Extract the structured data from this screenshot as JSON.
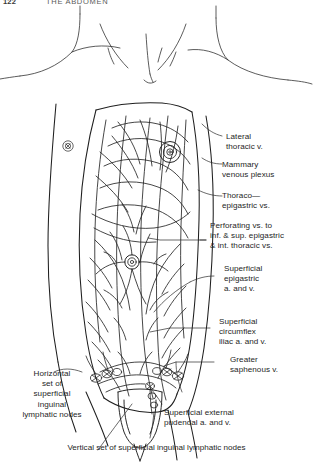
{
  "header": {
    "folio": "122",
    "running_title": "THE ABDOMEN"
  },
  "figure": {
    "ink_color": "#1f1f1f",
    "line_color": "#3a3a3a"
  },
  "labels": [
    {
      "id": "lateral-thoracic-vein",
      "text": "Lateral\nthoracic v."
    },
    {
      "id": "mammary-venous-plexus",
      "text": "Mammary\nvenous plexus"
    },
    {
      "id": "thoraco-epigastric-veins",
      "text": "Thoraco—\nepigastric vs."
    },
    {
      "id": "perforating-veins",
      "text": "Perforating vs. to\ninf. & sup. epigastric\n& int. thoracic vs."
    },
    {
      "id": "superficial-epigastric",
      "text": "Superficial\nepigastric\na. and v."
    },
    {
      "id": "superficial-circumflex-iliac",
      "text": "Superficial\ncircumflex\niliac a. and v."
    },
    {
      "id": "greater-saphenous-vein",
      "text": "Greater\nsaphenous v."
    },
    {
      "id": "superficial-external-pudendal",
      "text": "Superficial external\npudendal a. and v."
    },
    {
      "id": "horizontal-inguinal-nodes",
      "text": "Horizontal\nset of\nsuperficial\ninguinal\nlymphatic nodes"
    }
  ],
  "caption": {
    "text": "Vertical set of superficial inguinal lymphatic nodes"
  }
}
